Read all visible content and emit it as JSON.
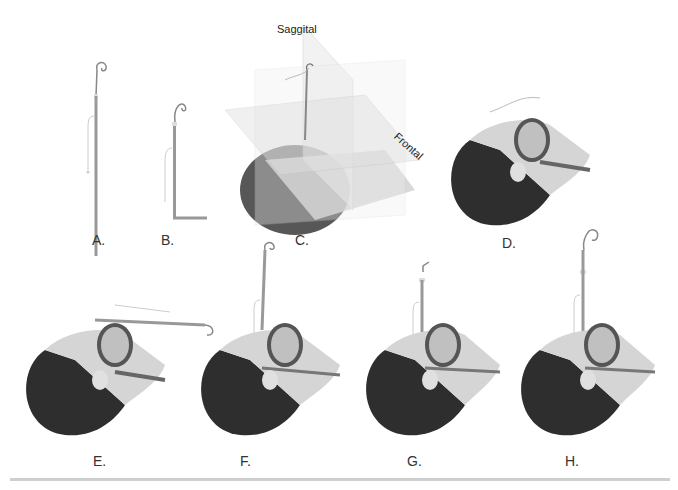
{
  "figure": {
    "panels": [
      {
        "id": "A",
        "label": "A.",
        "description": "Straight intubating stylet with tube, curled tip"
      },
      {
        "id": "B",
        "label": "B.",
        "description": "Stylet bent at right angle (hockey-stick)"
      },
      {
        "id": "C",
        "label": "C.",
        "description": "Head with three anatomical planes",
        "plane_labels": {
          "saggital": "Saggital",
          "frontal": "Frontal"
        }
      },
      {
        "id": "D",
        "label": "D.",
        "description": "Supine head, mouth open with laryngoscope"
      },
      {
        "id": "E",
        "label": "E.",
        "description": "Tube introduced horizontally across mouth"
      },
      {
        "id": "F",
        "label": "F.",
        "description": "Tube rotated to vertical, advanced into airway"
      },
      {
        "id": "G",
        "label": "G.",
        "description": "Stylet withdrawn, tip bent"
      },
      {
        "id": "H",
        "label": "H.",
        "description": "Tube in position with curled stylet"
      }
    ]
  },
  "colors": {
    "hair": "#2a2a2a",
    "skin": "#d8d8d8",
    "tube": "#8a8a8a",
    "plane": "#e6e6e6",
    "rule": "#cfcfcf"
  }
}
